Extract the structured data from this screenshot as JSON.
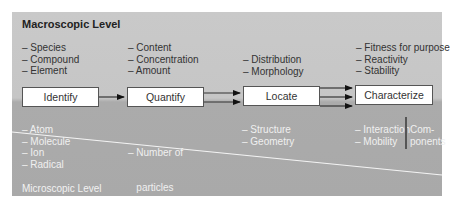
{
  "levels": {
    "macroscopic": "Macroscopic Level",
    "microscopic": "Microscopic Level"
  },
  "steps": [
    {
      "label": "Identify",
      "macro": [
        "– Species",
        "– Compound",
        "– Element"
      ],
      "micro": [
        "– Atom",
        "– Molecule",
        "– Ion",
        "– Radical"
      ]
    },
    {
      "label": "Quantify",
      "macro": [
        "– Content",
        "– Concentration",
        "– Amount"
      ],
      "micro": [
        "– Number of",
        "   particles"
      ]
    },
    {
      "label": "Locate",
      "macro": [
        "– Distribution",
        "– Morphology"
      ],
      "micro": [
        "– Structure",
        "– Geometry"
      ]
    },
    {
      "label": "Characterize",
      "macro": [
        "– Fitness for purpose",
        "– Reactivity",
        "– Stability"
      ],
      "micro": [
        "– Interaction",
        "– Mobility"
      ],
      "micro_group": [
        "Com-",
        "ponents"
      ]
    }
  ],
  "arrows": [
    {
      "from": "Identify",
      "to": "Quantify",
      "count": 1
    },
    {
      "from": "Quantify",
      "to": "Locate",
      "count": 2
    },
    {
      "from": "Locate",
      "to": "Characterize",
      "count": 3
    }
  ],
  "colors": {
    "macro_bg": "#c8c8c8",
    "micro_bg": "#aaaaaa",
    "divider": "#ffffff",
    "box_border": "#555555"
  }
}
